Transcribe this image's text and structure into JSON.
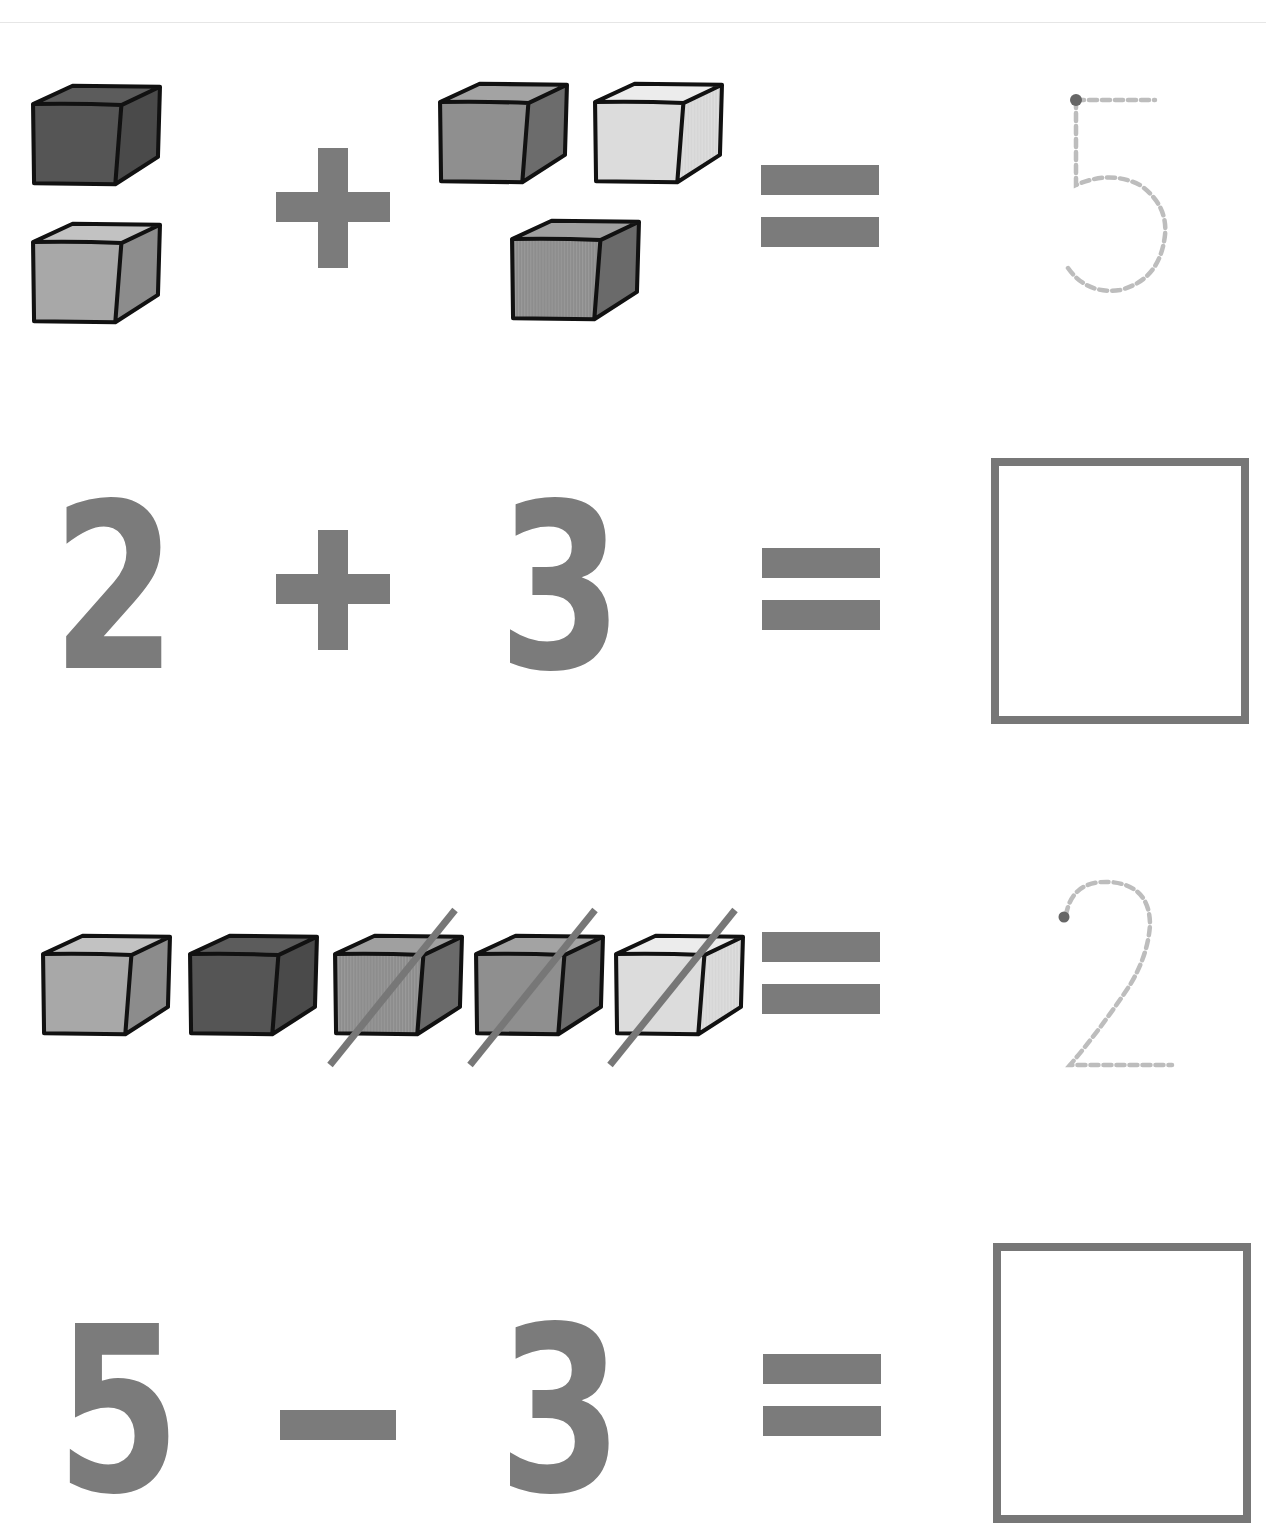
{
  "worksheet": {
    "colors": {
      "symbol": "#7b7b7b",
      "box_border": "#777777",
      "trace_dash": "#bdbdbd",
      "trace_dot": "#666666",
      "cube_outline": "#111111",
      "strike": "#777777"
    },
    "row1": {
      "description": "picture addition",
      "left_group": {
        "count": 2,
        "cubes": [
          "dark",
          "light"
        ]
      },
      "operator": "+",
      "right_group": {
        "count": 3,
        "cubes": [
          "medium",
          "pale",
          "medium-dotted"
        ]
      },
      "equals": "=",
      "answer_trace": "5"
    },
    "row2": {
      "description": "numeric addition",
      "operand1": "2",
      "operator": "+",
      "operand2": "3",
      "equals": "=",
      "answer_box": ""
    },
    "row3": {
      "description": "picture subtraction",
      "cubes": [
        {
          "shade": "light",
          "crossed": false
        },
        {
          "shade": "dark",
          "crossed": false
        },
        {
          "shade": "medium-dotted",
          "crossed": true
        },
        {
          "shade": "medium",
          "crossed": true
        },
        {
          "shade": "pale",
          "crossed": true
        }
      ],
      "equals": "=",
      "answer_trace": "2"
    },
    "row4": {
      "description": "numeric subtraction",
      "operand1": "5",
      "operator": "–",
      "operand2": "3",
      "equals": "=",
      "answer_box": ""
    }
  }
}
